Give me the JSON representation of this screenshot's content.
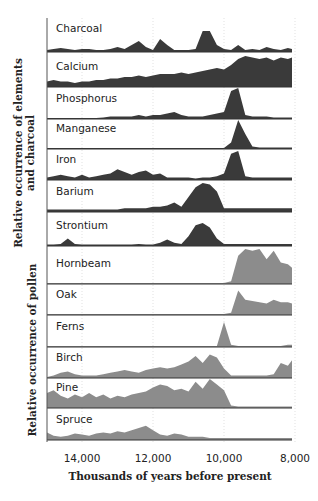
{
  "chart_data": {
    "type": "area",
    "title": "",
    "xlabel": "Thousands of years before present",
    "ylabel_groups": [
      {
        "label": "Relative occurrence of elements and charcoal",
        "series": [
          "Charcoal",
          "Calcium",
          "Phosphorus",
          "Manganese",
          "Iron",
          "Barium",
          "Strontium"
        ]
      },
      {
        "label": "Relative occurrence of pollen",
        "series": [
          "Hornbeam",
          "Oak",
          "Ferns",
          "Birch",
          "Pine",
          "Spruce"
        ]
      }
    ],
    "x_ticks": [
      14000,
      12000,
      10000,
      8000
    ],
    "x_tick_labels": [
      "14,000",
      "12,000",
      "10,000",
      "8,000"
    ],
    "xlim": [
      15000,
      8000
    ],
    "x_reversed": true,
    "grid": "dotted vertical at ticks",
    "colors": {
      "elements": "#3a3a3a",
      "pollen": "#8c8c8c"
    },
    "x": [
      15000,
      14800,
      14600,
      14400,
      14200,
      14000,
      13800,
      13600,
      13400,
      13200,
      13000,
      12800,
      12600,
      12400,
      12200,
      12000,
      11800,
      11600,
      11400,
      11200,
      11000,
      10800,
      10600,
      10400,
      10200,
      10000,
      9800,
      9600,
      9400,
      9200,
      9000,
      8800,
      8600,
      8400,
      8200,
      8000
    ],
    "series": [
      {
        "name": "Charcoal",
        "group": "elements",
        "values": [
          0.05,
          0.1,
          0.15,
          0.1,
          0.05,
          0.1,
          0.1,
          0.05,
          0.05,
          0.1,
          0.2,
          0.1,
          0.3,
          0.5,
          0.2,
          0.05,
          0.6,
          0.3,
          0.05,
          0.05,
          0.05,
          0.1,
          1.0,
          1.0,
          0.3,
          0.1,
          0.05,
          0.3,
          0.05,
          0.1,
          0.05,
          0.2,
          0.1,
          0.05,
          0.15,
          0.1
        ]
      },
      {
        "name": "Calcium",
        "group": "elements",
        "values": [
          0.15,
          0.2,
          0.15,
          0.15,
          0.1,
          0.15,
          0.15,
          0.2,
          0.2,
          0.25,
          0.25,
          0.3,
          0.3,
          0.35,
          0.3,
          0.35,
          0.4,
          0.4,
          0.4,
          0.45,
          0.4,
          0.45,
          0.5,
          0.55,
          0.6,
          0.55,
          0.7,
          0.9,
          1.0,
          0.95,
          0.9,
          0.95,
          0.85,
          0.95,
          0.9,
          0.95
        ]
      },
      {
        "name": "Phosphorus",
        "group": "elements",
        "values": [
          0,
          0,
          0,
          0,
          0,
          0,
          0,
          0,
          0.02,
          0.05,
          0.05,
          0.05,
          0.05,
          0.1,
          0.05,
          0.1,
          0.1,
          0.15,
          0.2,
          0.1,
          0.05,
          0.05,
          0.05,
          0.1,
          0.15,
          0.2,
          0.9,
          1.0,
          0.1,
          0.05,
          0.05,
          0.05,
          0.02,
          0.02,
          0.02,
          0.02
        ]
      },
      {
        "name": "Manganese",
        "group": "elements",
        "values": [
          0,
          0,
          0,
          0,
          0,
          0,
          0,
          0,
          0,
          0,
          0,
          0,
          0,
          0,
          0,
          0,
          0,
          0,
          0,
          0,
          0,
          0,
          0,
          0,
          0,
          0,
          0.2,
          1.0,
          0.5,
          0.05,
          0.02,
          0.02,
          0.02,
          0.02,
          0.02,
          0.02
        ]
      },
      {
        "name": "Iron",
        "group": "elements",
        "values": [
          0.05,
          0.1,
          0.15,
          0.1,
          0.05,
          0.15,
          0.05,
          0.1,
          0.15,
          0.2,
          0.35,
          0.25,
          0.15,
          0.25,
          0.3,
          0.15,
          0.2,
          0.05,
          0.05,
          0.05,
          0.05,
          0.02,
          0.05,
          0.05,
          0.1,
          0.2,
          0.9,
          1.0,
          0.1,
          0.05,
          0.05,
          0.05,
          0.05,
          0.05,
          0.05,
          0.05
        ]
      },
      {
        "name": "Barium",
        "group": "elements",
        "values": [
          0.05,
          0.05,
          0.05,
          0.05,
          0.05,
          0.05,
          0.05,
          0.05,
          0.05,
          0.05,
          0.05,
          0.1,
          0.1,
          0.1,
          0.1,
          0.15,
          0.15,
          0.2,
          0.3,
          0.15,
          0.5,
          0.85,
          1.0,
          0.95,
          0.7,
          0.1,
          0.1,
          0.1,
          0.1,
          0.1,
          0.1,
          0.1,
          0.1,
          0.1,
          0.1,
          0.1
        ]
      },
      {
        "name": "Strontium",
        "group": "elements",
        "values": [
          0.02,
          0.02,
          0.05,
          0.3,
          0.05,
          0.02,
          0.02,
          0.02,
          0.02,
          0.02,
          0.02,
          0.02,
          0.02,
          0.05,
          0.02,
          0.02,
          0.1,
          0.25,
          0.1,
          0.05,
          0.4,
          0.9,
          1.0,
          0.8,
          0.3,
          0.05,
          0.05,
          0.05,
          0.05,
          0.05,
          0.05,
          0.05,
          0.05,
          0.05,
          0.05,
          0.05
        ]
      },
      {
        "name": "Hornbeam",
        "group": "pollen",
        "values": [
          0,
          0,
          0,
          0,
          0,
          0,
          0,
          0,
          0,
          0,
          0,
          0,
          0,
          0,
          0,
          0,
          0,
          0,
          0,
          0,
          0,
          0,
          0,
          0,
          0,
          0,
          0.05,
          0.8,
          1.0,
          0.95,
          1.0,
          0.7,
          0.95,
          0.6,
          0.55,
          0.45
        ]
      },
      {
        "name": "Oak",
        "group": "pollen",
        "values": [
          0,
          0,
          0,
          0,
          0,
          0,
          0,
          0,
          0,
          0,
          0,
          0,
          0,
          0,
          0,
          0,
          0,
          0,
          0,
          0,
          0,
          0,
          0,
          0,
          0,
          0,
          0.05,
          0.9,
          0.55,
          0.5,
          0.45,
          0.4,
          0.55,
          0.45,
          0.45,
          0.4
        ]
      },
      {
        "name": "Ferns",
        "group": "pollen",
        "values": [
          0,
          0,
          0,
          0,
          0,
          0,
          0,
          0,
          0,
          0,
          0,
          0,
          0,
          0,
          0,
          0,
          0,
          0,
          0,
          0,
          0,
          0,
          0,
          0,
          0,
          1.0,
          0.05,
          0,
          0,
          0,
          0,
          0,
          0,
          0,
          0.05,
          0.05
        ]
      },
      {
        "name": "Birch",
        "group": "pollen",
        "values": [
          0,
          0.05,
          0.15,
          0.2,
          0.1,
          0.05,
          0.05,
          0.05,
          0.1,
          0.15,
          0.2,
          0.25,
          0.2,
          0.15,
          0.25,
          0.3,
          0.35,
          0.3,
          0.35,
          0.45,
          0.55,
          0.75,
          0.5,
          0.8,
          0.7,
          0.3,
          0.05,
          0.05,
          0.05,
          0.05,
          0.05,
          0.05,
          0.1,
          0.5,
          0.4,
          0.6
        ]
      },
      {
        "name": "Pine",
        "group": "pollen",
        "values": [
          0.5,
          0.6,
          0.4,
          0.3,
          0.45,
          0.35,
          0.5,
          0.35,
          0.45,
          0.3,
          0.4,
          0.35,
          0.45,
          0.5,
          0.55,
          0.7,
          0.8,
          0.75,
          0.6,
          0.65,
          0.55,
          0.9,
          0.65,
          1.0,
          0.8,
          0.6,
          0.05,
          0.02,
          0.02,
          0.02,
          0.02,
          0.02,
          0.02,
          0.02,
          0.02,
          0.02
        ]
      },
      {
        "name": "Spruce",
        "group": "pollen",
        "values": [
          0.3,
          0.15,
          0.1,
          0.15,
          0.25,
          0.2,
          0.15,
          0.25,
          0.3,
          0.25,
          0.35,
          0.3,
          0.4,
          0.5,
          0.6,
          0.4,
          0.2,
          0.15,
          0.25,
          0.2,
          0.1,
          0.1,
          0.1,
          0.05,
          0.05,
          0.05,
          0.05,
          0.05,
          0.05,
          0.05,
          0.05,
          0.05,
          0.05,
          0.05,
          0.05,
          0.05
        ]
      }
    ]
  }
}
